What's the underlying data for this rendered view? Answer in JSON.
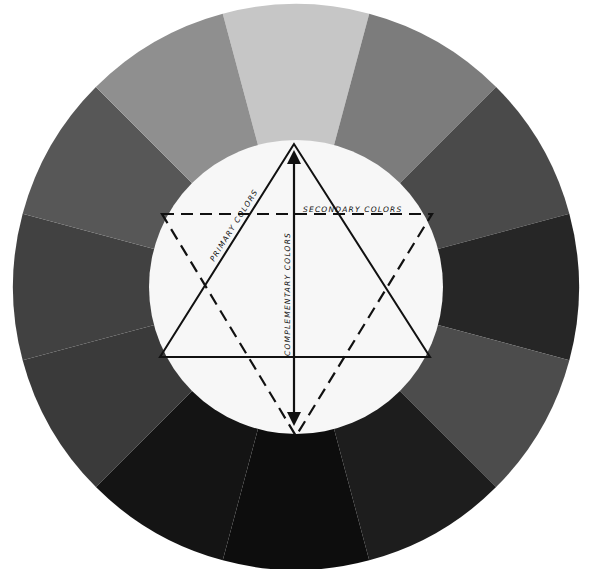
{
  "diagram": {
    "type": "color-wheel",
    "segment_count": 12,
    "segments": [
      {
        "index": 0,
        "position": "top",
        "color": "#c6c6c6"
      },
      {
        "index": 1,
        "position": "top-right",
        "color": "#7c7c7c"
      },
      {
        "index": 2,
        "position": "right-upper",
        "color": "#4a4a4a"
      },
      {
        "index": 3,
        "position": "right",
        "color": "#262626"
      },
      {
        "index": 4,
        "position": "right-lower",
        "color": "#4c4c4c"
      },
      {
        "index": 5,
        "position": "bottom-right",
        "color": "#1d1d1d"
      },
      {
        "index": 6,
        "position": "bottom",
        "color": "#0d0d0d"
      },
      {
        "index": 7,
        "position": "bottom-left",
        "color": "#141414"
      },
      {
        "index": 8,
        "position": "left-lower",
        "color": "#3a3a3a"
      },
      {
        "index": 9,
        "position": "left",
        "color": "#414141"
      },
      {
        "index": 10,
        "position": "left-upper",
        "color": "#575757"
      },
      {
        "index": 11,
        "position": "top-left",
        "color": "#8f8f8f"
      }
    ],
    "center_fill": "#f7f7f7",
    "labels": {
      "primary": "PRIMARY COLORS",
      "secondary": "SECONDARY COLORS",
      "complementary": "COMPLEMENTARY COLORS"
    }
  }
}
